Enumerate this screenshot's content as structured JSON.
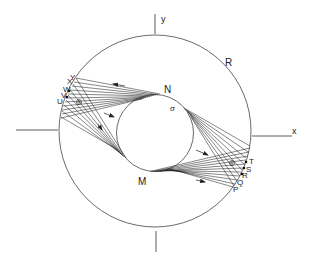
{
  "diagram": {
    "type": "geometric diagram - annular region with tangent line fans",
    "colors": {
      "stroke": "#333333",
      "background": "#ffffff"
    },
    "axes": {
      "x_label": "x",
      "y_label": "y"
    },
    "outer_circle": {
      "label": "R"
    },
    "inner_circle": {
      "top_point_label": "N",
      "bottom_point_label": "M",
      "stress_label": "σ"
    },
    "left_fan_labels": [
      "U",
      "V",
      "W",
      "X",
      "Y"
    ],
    "right_fan_labels": [
      "P",
      "Q",
      "R",
      "S",
      "T"
    ],
    "symbols": {
      "left_circled_cross": "⊕",
      "right_circled_cross": "⊕"
    }
  }
}
